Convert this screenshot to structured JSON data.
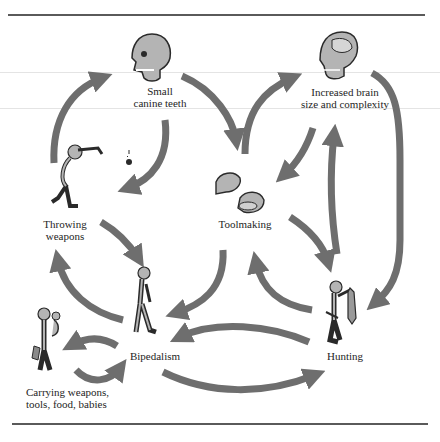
{
  "diagram": {
    "nodes": [
      {
        "id": "small-canine-teeth",
        "label_line1": "Small",
        "label_line2": "canine teeth",
        "icon": "skull-icon"
      },
      {
        "id": "increased-brain",
        "label_line1": "Increased brain",
        "label_line2": "size and complexity",
        "icon": "skull-large-brain-icon"
      },
      {
        "id": "throwing-weapons",
        "label_line1": "Throwing",
        "label_line2": "weapons",
        "icon": "throwing-figure-icon"
      },
      {
        "id": "toolmaking",
        "label_line1": "Toolmaking",
        "label_line2": "",
        "icon": "hands-stone-icon"
      },
      {
        "id": "bipedalism",
        "label_line1": "Bipedalism",
        "label_line2": "",
        "icon": "walking-figure-icon"
      },
      {
        "id": "hunting",
        "label_line1": "Hunting",
        "label_line2": "",
        "icon": "hunter-figure-icon"
      },
      {
        "id": "carrying",
        "label_line1": "Carrying weapons,",
        "label_line2": "tools, food, babies",
        "icon": "carrying-figure-icon"
      }
    ],
    "edges": [
      {
        "from": "throwing-weapons",
        "to": "small-canine-teeth"
      },
      {
        "from": "small-canine-teeth",
        "to": "throwing-weapons"
      },
      {
        "from": "small-canine-teeth",
        "to": "toolmaking"
      },
      {
        "from": "toolmaking",
        "to": "increased-brain"
      },
      {
        "from": "increased-brain",
        "to": "toolmaking"
      },
      {
        "from": "increased-brain",
        "to": "hunting"
      },
      {
        "from": "throwing-weapons",
        "to": "bipedalism"
      },
      {
        "from": "bipedalism",
        "to": "throwing-weapons"
      },
      {
        "from": "toolmaking",
        "to": "bipedalism"
      },
      {
        "from": "hunting",
        "to": "toolmaking"
      },
      {
        "from": "toolmaking",
        "to": "hunting"
      },
      {
        "from": "hunting",
        "to": "increased-brain"
      },
      {
        "from": "hunting",
        "to": "bipedalism"
      },
      {
        "from": "bipedalism",
        "to": "hunting"
      },
      {
        "from": "bipedalism",
        "to": "carrying"
      },
      {
        "from": "carrying",
        "to": "bipedalism"
      }
    ],
    "colors": {
      "arrow": "#6e6e6e",
      "rule": "#5a5a5a",
      "figure_fill": "#b4b4b4",
      "figure_stroke": "#2a2a2a",
      "text": "#1e1e1e"
    }
  }
}
